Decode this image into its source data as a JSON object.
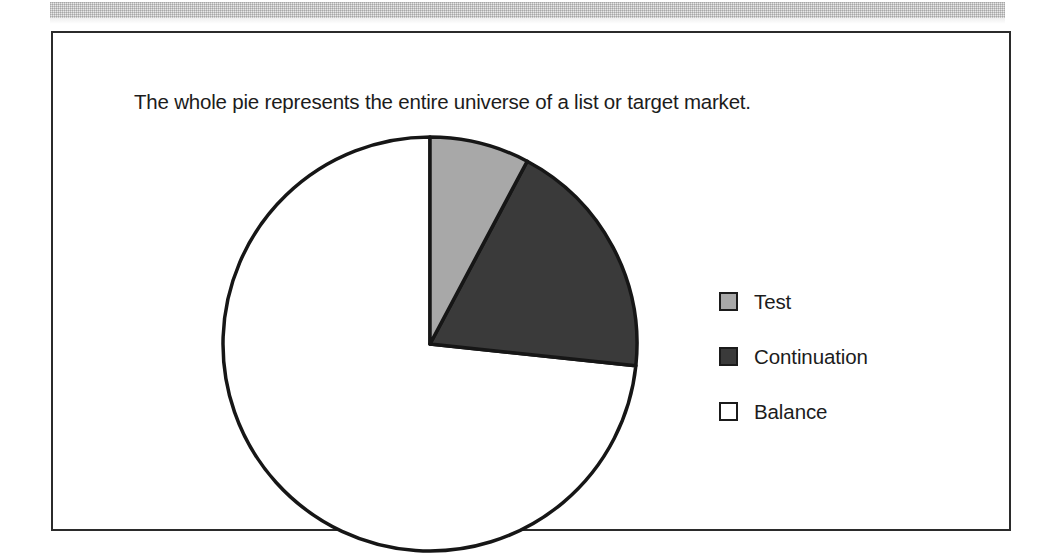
{
  "page": {
    "background_color": "#ffffff",
    "scan_band_color": "#e7e7e7"
  },
  "figure": {
    "border_color": "#2b2b2b",
    "caption": "The whole pie represents the entire universe of a list or target market."
  },
  "legend": {
    "position": "right",
    "items": [
      {
        "label": "Test",
        "color": "#a8a8a8",
        "border_color": "#1b1b1b"
      },
      {
        "label": "Continuation",
        "color": "#3a3a3a",
        "border_color": "#1b1b1b"
      },
      {
        "label": "Balance",
        "color": "#ffffff",
        "border_color": "#1b1b1b"
      }
    ]
  },
  "chart_data": {
    "type": "pie",
    "title": "",
    "subtitle": "",
    "xlabel": "",
    "ylabel": "",
    "grid": false,
    "legend_position": "right",
    "start_angle_deg": 0,
    "direction": "clockwise",
    "center": {
      "x": 377,
      "y": 311
    },
    "radius": 207,
    "categories": [
      "Test",
      "Continuation",
      "Balance"
    ],
    "values": [
      7.8,
      18.9,
      73.3
    ],
    "value_unit": "percent",
    "angles_deg": [
      28,
      68,
      264
    ],
    "colors": [
      "#a8a8a8",
      "#3a3a3a",
      "#ffffff"
    ],
    "slice_outline_color": "#161616",
    "slices": [
      {
        "name": "Test",
        "percent": 7.8,
        "angle_deg": 28,
        "color": "#a8a8a8"
      },
      {
        "name": "Continuation",
        "percent": 18.9,
        "angle_deg": 68,
        "color": "#3a3a3a"
      },
      {
        "name": "Balance",
        "percent": 73.3,
        "angle_deg": 264,
        "color": "#ffffff"
      }
    ],
    "annotations": [
      "The whole pie represents the entire universe of a list or target market."
    ]
  }
}
